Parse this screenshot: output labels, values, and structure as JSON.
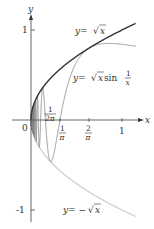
{
  "chart_data": {
    "type": "line",
    "title": "",
    "xlabel": "x",
    "ylabel": "y",
    "xlim": [
      0,
      1.15
    ],
    "ylim": [
      -1,
      1.1
    ],
    "grid": false,
    "x_ticks": [
      {
        "value": 0,
        "label": "0"
      },
      {
        "value": 0.159,
        "label": "1/(2π)"
      },
      {
        "value": 0.318,
        "label": "1/π"
      },
      {
        "value": 0.637,
        "label": "2/π"
      },
      {
        "value": 1,
        "label": "1"
      }
    ],
    "y_ticks": [
      {
        "value": 1,
        "label": "1"
      },
      {
        "value": -1,
        "label": "-1"
      }
    ],
    "series": [
      {
        "name": "y = √x",
        "function": "sqrt(x)",
        "color": "#333333",
        "x": [
          0,
          0.25,
          0.5,
          0.75,
          1,
          1.15
        ],
        "values": [
          0,
          0.5,
          0.707,
          0.866,
          1,
          1.072
        ]
      },
      {
        "name": "y = √x sin(1/x)",
        "function": "sqrt(x)*sin(1/x)",
        "color": "#888888",
        "x": [
          0.159,
          0.212,
          0.318,
          0.5,
          0.637,
          1,
          1.15
        ],
        "values": [
          0,
          -0.46,
          0,
          0.643,
          0.798,
          0.841,
          0.81
        ]
      },
      {
        "name": "y = -√x",
        "function": "-sqrt(x)",
        "color": "#cccccc",
        "x": [
          0,
          0.25,
          0.5,
          0.75,
          1,
          1.15
        ],
        "values": [
          0,
          -0.5,
          -0.707,
          -0.866,
          -1,
          -1.072
        ]
      }
    ],
    "annotations": [
      {
        "text": "y = √x",
        "near": "upper curve"
      },
      {
        "text": "y = √x sin 1/x",
        "near": "middle oscillating curve"
      },
      {
        "text": "y = -√x",
        "near": "lower curve"
      }
    ]
  },
  "labels": {
    "x_axis": "x",
    "y_axis": "y",
    "origin": "0",
    "y_one": "1",
    "y_neg_one": "-1",
    "tick_one": "1",
    "frac_num": "1",
    "two": "2",
    "pi": "π",
    "two_pi": "2π",
    "eq_sqrt_y": "y",
    "eq_eq": " = ",
    "eq_x": "x",
    "eq_sin": " sin ",
    "eq_neg": " = −",
    "sqrt_sym": "√"
  }
}
